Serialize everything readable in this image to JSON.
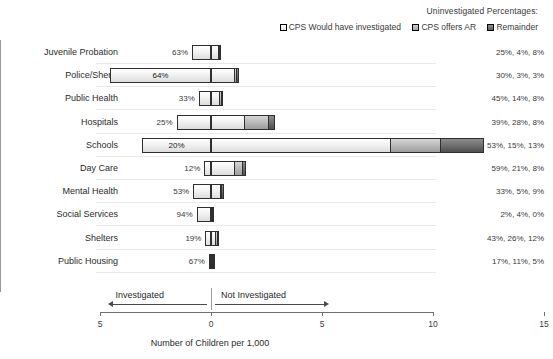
{
  "legend": {
    "title": "Uninvestigated Percentages:",
    "items": [
      {
        "label": "CPS Would have investigated",
        "swatch": "legend-swatch-light",
        "color": "#f0f0f0"
      },
      {
        "label": "CPS offers AR",
        "swatch": "legend-swatch-medium",
        "color": "#bcbcbc"
      },
      {
        "label": "Remainder",
        "swatch": "legend-swatch-dark",
        "color": "#6e6e6e"
      }
    ]
  },
  "annotations": {
    "investigated": "Investigated",
    "not_investigated": "Not Investigated"
  },
  "chart_data": {
    "type": "bar",
    "title": "",
    "subtitle": "",
    "orientation": "horizontal",
    "style": "diverging-stacked",
    "xlabel": "Number of Children per 1,000",
    "ylabel": "",
    "xlim": [
      -5,
      15
    ],
    "xticks": [
      -5,
      0,
      5,
      10,
      15
    ],
    "xtick_labels": [
      "5",
      "0",
      "5",
      "10",
      "15"
    ],
    "grid": false,
    "legend_position": "top-right",
    "categories": [
      "Juvenile Probation",
      "Police/Sheriff",
      "Public Health",
      "Hospitals",
      "Schools",
      "Day Care",
      "Mental Health",
      "Social Services",
      "Shelters",
      "Public Housing"
    ],
    "series": [
      {
        "name": "Investigated",
        "side": "left",
        "values": [
          -0.85,
          -4.55,
          -0.55,
          -1.55,
          -3.1,
          -0.3,
          -0.8,
          -0.65,
          -0.25,
          -0.1
        ]
      },
      {
        "name": "CPS Would have investigated",
        "side": "right",
        "values": [
          0.35,
          1.1,
          0.42,
          1.55,
          8.1,
          1.1,
          0.45,
          0.02,
          0.22,
          0.05
        ]
      },
      {
        "name": "CPS offers AR",
        "side": "right",
        "values": [
          0.06,
          0.12,
          0.13,
          1.1,
          2.3,
          0.4,
          0.07,
          0.03,
          0.13,
          0.03
        ]
      },
      {
        "name": "Remainder",
        "side": "right",
        "values": [
          0.11,
          0.12,
          0.08,
          0.32,
          2.0,
          0.15,
          0.12,
          0.0,
          0.06,
          0.02
        ]
      }
    ],
    "left_labels": [
      "63%",
      "64%",
      "33%",
      "25%",
      "20%",
      "12%",
      "53%",
      "94%",
      "19%",
      "67%"
    ],
    "right_labels": [
      "25%, 4%, 8%",
      "30%, 3%, 3%",
      "45%, 14%, 8%",
      "39%, 28%, 8%",
      "53%, 15%, 13%",
      "59%, 21%, 8%",
      "33%, 5%, 9%",
      "2%, 4%, 0%",
      "43%, 26%, 12%",
      "17%, 11%, 5%"
    ]
  }
}
